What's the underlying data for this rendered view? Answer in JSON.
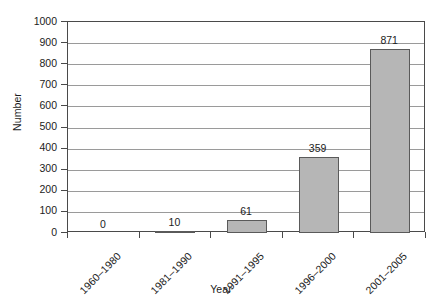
{
  "chart_data": {
    "type": "bar",
    "title": "",
    "xlabel": "Year",
    "ylabel": "Number",
    "categories": [
      "1960–1980",
      "1981–1990",
      "1991–1995",
      "1996–2000",
      "2001–2005"
    ],
    "values": [
      0,
      10,
      61,
      359,
      871
    ],
    "value_labels": [
      "0",
      "10",
      "61",
      "359",
      "871"
    ],
    "ylim": [
      0,
      1000
    ],
    "ytick_labels": [
      "1000",
      "900",
      "800",
      "700",
      "600",
      "500",
      "400",
      "300",
      "200",
      "100",
      "0"
    ],
    "ytick_values": [
      1000,
      900,
      800,
      700,
      600,
      500,
      400,
      300,
      200,
      100,
      0
    ],
    "grid": true,
    "legend": "none",
    "series": [
      {
        "name": "Number",
        "values": [
          0,
          10,
          61,
          359,
          871
        ],
        "bar_color": "#b6b6b6",
        "bar_border_color": "#5a5a5a"
      }
    ],
    "colors": {
      "bar_fill": "#b6b6b6",
      "bar_border": "#5a5a5a",
      "gridline": "#9a9a9a",
      "axis": "#4a4a4a",
      "text": "#1c1c1c",
      "background": "#ffffff"
    }
  }
}
